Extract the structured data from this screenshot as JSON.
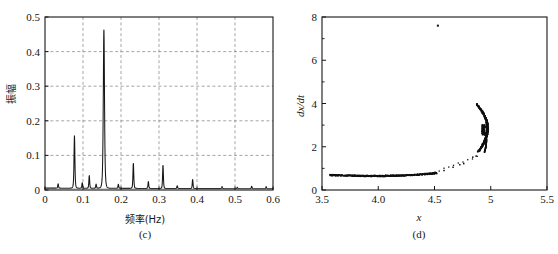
{
  "figure": {
    "background": "#ffffff",
    "ink": "#161616",
    "grid_color": "#808080"
  },
  "panels": [
    {
      "id": "c",
      "caption": "(c)",
      "xlabel": "频率(Hz)",
      "ylabel": "振幅",
      "xticks": [
        "0",
        "0.1",
        "0.2",
        "0.3",
        "0.4",
        "0.5",
        "0.6"
      ],
      "yticks": [
        "0",
        "0.1",
        "0.2",
        "0.3",
        "0.4",
        "0.5"
      ]
    },
    {
      "id": "d",
      "caption": "(d)",
      "xlabel": "x",
      "ylabel": "dx/dt",
      "xticks": [
        "3.5",
        "4.0",
        "4.5",
        "5",
        "5.5"
      ],
      "yticks": [
        "0",
        "2",
        "4",
        "6",
        "8"
      ]
    }
  ],
  "chart_data": [
    {
      "type": "line",
      "id": "c",
      "title": "",
      "subtitle": "(c)",
      "xlabel": "频率(Hz)",
      "ylabel": "振幅",
      "xlim": [
        0,
        0.6
      ],
      "ylim": [
        0,
        0.5
      ],
      "xticks": [
        0,
        0.1,
        0.2,
        0.3,
        0.4,
        0.5,
        0.6
      ],
      "yticks": [
        0,
        0.1,
        0.2,
        0.3,
        0.4,
        0.5
      ],
      "grid": true,
      "grid_style": "dashed",
      "legend": "none",
      "description": "Amplitude spectrum (FFT magnitude) with sharp harmonic peaks; fundamental near 0.0775 Hz and dominant peak at 0.155 Hz.",
      "peaks": [
        {
          "freq": 0.0345,
          "amp": 0.013
        },
        {
          "freq": 0.0775,
          "amp": 0.152
        },
        {
          "freq": 0.098,
          "amp": 0.016
        },
        {
          "freq": 0.1165,
          "amp": 0.037
        },
        {
          "freq": 0.1345,
          "amp": 0.012
        },
        {
          "freq": 0.155,
          "amp": 0.46
        },
        {
          "freq": 0.193,
          "amp": 0.012
        },
        {
          "freq": 0.2325,
          "amp": 0.074
        },
        {
          "freq": 0.272,
          "amp": 0.02
        },
        {
          "freq": 0.3105,
          "amp": 0.068
        },
        {
          "freq": 0.348,
          "amp": 0.008
        },
        {
          "freq": 0.3885,
          "amp": 0.027
        },
        {
          "freq": 0.466,
          "amp": 0.006
        },
        {
          "freq": 0.506,
          "amp": 0.004
        },
        {
          "freq": 0.544,
          "amp": 0.007
        },
        {
          "freq": 0.582,
          "amp": 0.006
        }
      ],
      "baseline": 0.004
    },
    {
      "type": "scatter",
      "id": "d",
      "title": "",
      "subtitle": "(d)",
      "xlabel": "x",
      "ylabel": "dx/dt",
      "xlim": [
        3.5,
        5.5
      ],
      "ylim": [
        0,
        8
      ],
      "xticks": [
        3.5,
        4.0,
        4.5,
        5,
        5.5
      ],
      "yticks": [
        0,
        2,
        4,
        6,
        8
      ],
      "grid": false,
      "legend": "none",
      "description": "Poincare-style phase portrait: dense flat horizontal branch near dx/dt = 0.7 from x = 3.57 to x = 4.5, a sparse rising tail, and a dense crescent-shaped branch from (4.83, 3.95) curving down to (4.95, 1.75); one isolated outlier at (4.53, 7.6).",
      "marker_size": 1.4,
      "marker_color": "#101010",
      "outlier": {
        "x": 4.53,
        "y": 7.6
      },
      "branches": [
        {
          "name": "lower-flat-branch",
          "x_range": [
            3.57,
            4.52
          ],
          "y_range": [
            0.62,
            0.84
          ]
        },
        {
          "name": "sparse-rising-tail",
          "points": [
            {
              "x": 4.505,
              "y": 0.82
            },
            {
              "x": 4.585,
              "y": 0.9
            },
            {
              "x": 4.665,
              "y": 1.05
            },
            {
              "x": 4.725,
              "y": 1.17
            },
            {
              "x": 4.76,
              "y": 1.22
            },
            {
              "x": 4.84,
              "y": 1.52
            },
            {
              "x": 4.87,
              "y": 1.57
            }
          ]
        },
        {
          "name": "upper-crescent-branch",
          "y_range": [
            1.75,
            3.98
          ],
          "x_range": [
            4.83,
            4.965
          ]
        }
      ]
    }
  ]
}
